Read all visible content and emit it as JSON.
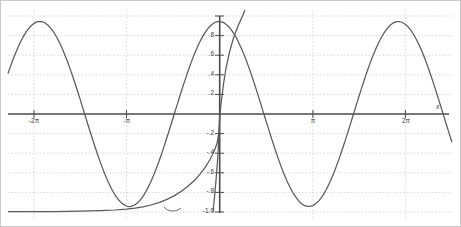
{
  "chart_data": {
    "type": "line",
    "title": "",
    "subtitle": "",
    "xlabel": "x",
    "ylabel": "",
    "xlim": [
      -7.4,
      8.2
    ],
    "ylim": [
      -1.06,
      1.06
    ],
    "grid": true,
    "legend": "none",
    "x_ticks": [
      {
        "value": -6.2832,
        "label": "-2π"
      },
      {
        "value": -3.1416,
        "label": "-π"
      },
      {
        "value": 3.1416,
        "label": "π"
      },
      {
        "value": 6.2832,
        "label": "2π"
      }
    ],
    "y_ticks": [
      {
        "value": 1.0,
        "label": ""
      },
      {
        "value": 0.8,
        "label": ".8"
      },
      {
        "value": 0.6,
        "label": ".6"
      },
      {
        "value": 0.4,
        "label": ".4"
      },
      {
        "value": 0.2,
        "label": ".2"
      },
      {
        "value": -0.2,
        "label": "-.2"
      },
      {
        "value": -0.4,
        "label": "-.4"
      },
      {
        "value": -0.6,
        "label": "-.6"
      },
      {
        "value": -0.8,
        "label": "-.8"
      },
      {
        "value": -1.0,
        "label": "-1.0"
      }
    ],
    "series": [
      {
        "name": "cos(x)",
        "color": "#555555",
        "expression": "cos(x)",
        "x": [
          -7.4,
          -7.0,
          -6.6,
          -6.2832,
          -6.0,
          -5.5,
          -5.0,
          -4.7124,
          -4.5,
          -4.0,
          -3.5,
          -3.1416,
          -3.0,
          -2.5,
          -2.0,
          -1.5708,
          -1.0,
          -0.5,
          0.0,
          0.5,
          1.0,
          1.5708,
          2.0,
          2.5,
          3.0,
          3.1416,
          3.5,
          4.0,
          4.5,
          4.7124,
          5.0,
          5.5,
          6.0,
          6.2832,
          6.6,
          7.0,
          7.4,
          8.2
        ],
        "y": [
          0.532,
          0.754,
          0.95,
          1.0,
          0.96,
          0.71,
          0.284,
          0.0,
          -0.211,
          -0.654,
          -0.936,
          -1.0,
          -0.99,
          -0.801,
          -0.416,
          0.0,
          0.54,
          0.878,
          1.0,
          0.878,
          0.54,
          0.0,
          -0.416,
          -0.801,
          -0.99,
          -1.0,
          -0.936,
          -0.654,
          -0.211,
          0.0,
          0.284,
          0.71,
          0.96,
          1.0,
          0.95,
          0.754,
          0.532,
          -0.267
        ]
      },
      {
        "name": "taylor-degree-2",
        "color": "#555555",
        "expression": "1 - x^2/2 clipped at -1",
        "note": "rises steeply through the origin region, exits top of frame"
      },
      {
        "name": "taylor-low-order",
        "color": "#555555",
        "expression": "flat near -1 for x < -pi then rises toward 0",
        "note": "hugs y = -1.0 on the left half, curves up crossing zero near x = 0"
      }
    ],
    "annotations": [
      {
        "text": "x",
        "role": "x-axis-name",
        "x": 7.95,
        "y": 0.11
      }
    ]
  }
}
